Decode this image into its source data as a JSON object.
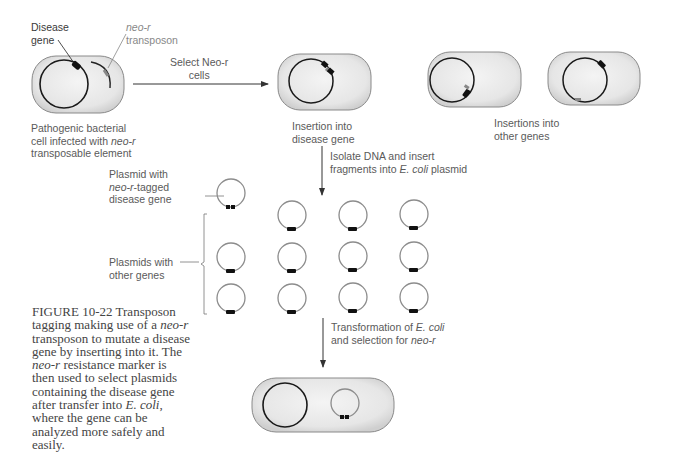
{
  "figure": {
    "number": "FIGURE 10-22",
    "caption_parts": [
      {
        "text": "FIGURE 10-22",
        "style": "label"
      },
      {
        "text": "  Transposon tagging making use of a ",
        "style": "normal"
      },
      {
        "text": "neo-r",
        "style": "italic"
      },
      {
        "text": " transposon to mutate a disease gene by inserting into it. The ",
        "style": "normal"
      },
      {
        "text": "neo-r",
        "style": "italic"
      },
      {
        "text": " resistance marker is then used to select plasmids containing the disease gene after transfer into ",
        "style": "normal"
      },
      {
        "text": "E. coli",
        "style": "italic"
      },
      {
        "text": ", where the gene can be analyzed more safely and easily.",
        "style": "normal"
      }
    ]
  },
  "labels": {
    "disease_gene": [
      "Disease",
      "gene"
    ],
    "neo_r_transposon": [
      "neo-r",
      "transposon"
    ],
    "pathogenic_cell": [
      "Pathogenic bacterial",
      "cell infected with ",
      "neo-r",
      "transposable element"
    ],
    "select_step": [
      "Select Neo-r",
      "cells"
    ],
    "insertion_disease": [
      "Insertion into",
      "disease gene"
    ],
    "insertion_other": [
      "Insertions into",
      "other genes"
    ],
    "isolate_step": [
      "Isolate DNA and insert",
      "fragments into ",
      "E. coli",
      " plasmid"
    ],
    "plasmid_tagged": [
      "Plasmid with",
      "neo-r",
      "-tagged",
      "disease gene"
    ],
    "plasmids_other": [
      "Plasmids with",
      "other genes"
    ],
    "transform_step": [
      "Transformation of ",
      "E. coli",
      "and selection for ",
      "neo-r"
    ]
  },
  "colors": {
    "cell_fill": "#e4e4e4",
    "cell_stroke": "#8a8a8a",
    "chromosome": "#1a1a1a",
    "plasmid": "#8c8c8c",
    "marker": "#111111",
    "arrow": "#333333",
    "text": "#5a5a5a"
  },
  "plasmid_grid": {
    "columns_x": [
      231,
      292,
      353,
      414
    ],
    "rows_y": [
      215,
      257,
      299
    ]
  }
}
